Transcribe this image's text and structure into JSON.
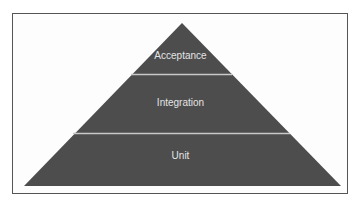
{
  "diagram": {
    "type": "pyramid",
    "colors": {
      "fill": "#4d4d4d",
      "divider": "#c9c9c9",
      "label": "#e4e4e4",
      "frame": "#555555",
      "background": "#ffffff"
    },
    "layers": [
      {
        "label": "Acceptance"
      },
      {
        "label": "Integration"
      },
      {
        "label": "Unit"
      }
    ]
  }
}
